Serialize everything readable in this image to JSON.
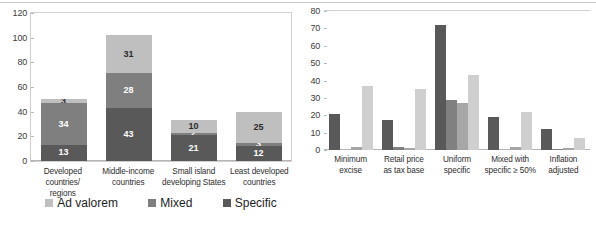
{
  "chart_data": [
    {
      "id": "left-chart",
      "type": "bar",
      "stacked": true,
      "title": "",
      "xlabel": "",
      "ylabel": "",
      "ylim": [
        0,
        120
      ],
      "yticks": [
        0,
        20,
        40,
        60,
        80,
        100,
        120
      ],
      "grid": false,
      "legend_position": "bottom",
      "categories": [
        "Developed countries/ regions",
        "Middle-income countries",
        "Small island developing States",
        "Least developed countries"
      ],
      "category_lines": [
        [
          "Developed countries/",
          "regions"
        ],
        [
          "Middle-income",
          "countries"
        ],
        [
          "Small island",
          "developing States"
        ],
        [
          "Least developed",
          "countries"
        ]
      ],
      "series": [
        {
          "name": "Specific",
          "color": "#595959",
          "values": [
            13,
            43,
            21,
            12
          ]
        },
        {
          "name": "Mixed",
          "color": "#7f7f7f",
          "values": [
            34,
            28,
            2,
            3
          ]
        },
        {
          "name": "Ad valorem",
          "color": "#bfbfbf",
          "values": [
            3,
            31,
            10,
            25
          ]
        }
      ],
      "legend_order": [
        "Ad valorem",
        "Mixed",
        "Specific"
      ]
    },
    {
      "id": "right-chart",
      "type": "bar",
      "stacked": false,
      "title": "",
      "xlabel": "",
      "ylabel": "",
      "ylim": [
        0,
        80
      ],
      "yticks": [
        0,
        10,
        20,
        30,
        40,
        50,
        60,
        70,
        80
      ],
      "grid": false,
      "legend_position": "bottom",
      "categories": [
        "Minimum excise",
        "Retail price as tax base",
        "Uniform specific",
        "Mixed with specific ≥ 50%",
        "Inflation adjusted"
      ],
      "category_lines": [
        [
          "Minimum",
          "excise"
        ],
        [
          "Retail price",
          "as tax base"
        ],
        [
          "Uniform",
          "specific"
        ],
        [
          "Mixed with",
          "specific ≥ 50%"
        ],
        [
          "Inflation",
          "adjusted"
        ]
      ],
      "series": [
        {
          "name": "Middle-income countries",
          "color": "#595959",
          "values": [
            21,
            17,
            72,
            19,
            12
          ]
        },
        {
          "name": "Least developed countries",
          "color": "#808080",
          "values": [
            0,
            2,
            29,
            0,
            0.5
          ]
        },
        {
          "name": "Small island developing States",
          "color": "#a6a6a6",
          "values": [
            2,
            1,
            27,
            2,
            1
          ]
        },
        {
          "name": "Developed regions",
          "color": "#cfcfcf",
          "values": [
            37,
            35,
            43,
            22,
            7
          ]
        }
      ],
      "legend_cells": [
        "Middle-income countries",
        "Small island developing States",
        "Least developed countries",
        "Developed regions"
      ],
      "legend_cell_lines": [
        [
          "Middle-income",
          "countries"
        ],
        [
          "Small island",
          "developing States"
        ],
        [
          "Least developed",
          "countries"
        ],
        [
          "Developed regions"
        ]
      ],
      "legend_cell_colors": [
        "#595959",
        "#a6a6a6",
        "#808080",
        "#cfcfcf"
      ]
    }
  ],
  "left": {
    "yticks": [
      "120",
      "100",
      "80",
      "60",
      "40",
      "20",
      "0"
    ],
    "labels": [
      {
        "l1": "Developed countries/",
        "l2": "regions"
      },
      {
        "l1": "Middle-income",
        "l2": "countries"
      },
      {
        "l1": "Small island",
        "l2": "developing States"
      },
      {
        "l1": "Least developed",
        "l2": "countries"
      }
    ],
    "bars": [
      {
        "specific": "13",
        "mixed": "34",
        "advalorem": "3"
      },
      {
        "specific": "43",
        "mixed": "28",
        "advalorem": "31"
      },
      {
        "specific": "21",
        "mixed": "2",
        "advalorem": "10"
      },
      {
        "specific": "12",
        "mixed": "3",
        "advalorem": "25"
      }
    ],
    "legend": [
      {
        "label": "Ad valorem",
        "color": "#bfbfbf"
      },
      {
        "label": "Mixed",
        "color": "#7f7f7f"
      },
      {
        "label": "Specific",
        "color": "#595959"
      }
    ]
  },
  "right": {
    "yticks": [
      "80",
      "70",
      "60",
      "50",
      "40",
      "30",
      "20",
      "10",
      "0"
    ],
    "labels": [
      {
        "l1": "Minimum",
        "l2": "excise"
      },
      {
        "l1": "Retail price",
        "l2": "as tax base"
      },
      {
        "l1": "Uniform",
        "l2": "specific"
      },
      {
        "l1": "Mixed with",
        "l2": "specific ≥ 50%"
      },
      {
        "l1": "Inflation",
        "l2": "adjusted"
      }
    ],
    "legend": [
      {
        "l1": "Middle-income",
        "l2": "countries",
        "color": "#595959"
      },
      {
        "l1": "Small island",
        "l2": "developing States",
        "color": "#a6a6a6"
      },
      {
        "l1": "Least developed",
        "l2": "countries",
        "color": "#808080"
      },
      {
        "l1": "Developed regions",
        "l2": "",
        "color": "#cfcfcf"
      }
    ]
  }
}
